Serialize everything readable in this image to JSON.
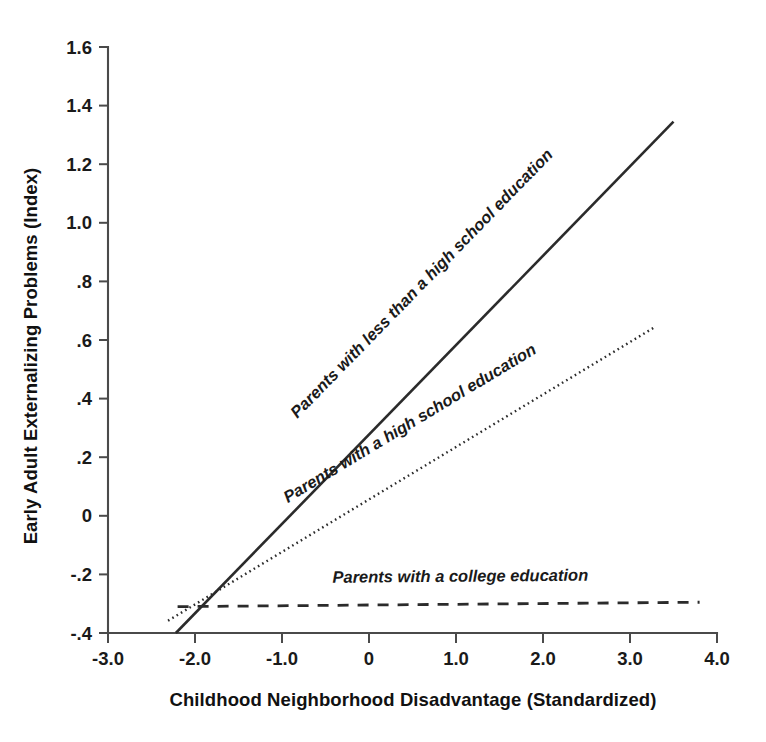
{
  "chart_data": {
    "type": "line",
    "title": "",
    "subtitle": "",
    "xlabel": "Childhood Neighborhood Disadvantage (Standardized)",
    "ylabel": "Early Adult Externalizing Problems (Index)",
    "xlim": [
      -3.0,
      4.0
    ],
    "ylim": [
      -0.4,
      1.6
    ],
    "grid": false,
    "legend_position": "inline-along-lines",
    "xticks": [
      -3.0,
      -2.0,
      -1.0,
      0,
      1.0,
      2.0,
      3.0,
      4.0
    ],
    "xticklabels": [
      "-3.0",
      "-2.0",
      "-1.0",
      "0",
      "1.0",
      "2.0",
      "3.0",
      "4.0"
    ],
    "yticks": [
      -0.4,
      -0.2,
      0,
      0.2,
      0.4,
      0.6,
      0.8,
      1.0,
      1.2,
      1.4,
      1.6
    ],
    "yticklabels": [
      "-.4",
      "-.2",
      "0",
      ".2",
      ".4",
      ".6",
      ".8",
      "1.0",
      "1.2",
      "1.4",
      "1.6"
    ],
    "series": [
      {
        "name": "Parents with less than a high school education",
        "style": "solid",
        "x": [
          -2.22,
          3.5
        ],
        "y": [
          -0.4,
          1.345
        ],
        "slope": 0.305,
        "intercept": 0.277,
        "label": "Parents with less than a high school education",
        "label_x": 0.65,
        "label_y": 0.78
      },
      {
        "name": "Parents with a high school education",
        "style": "dotted",
        "x": [
          -2.31,
          3.29
        ],
        "y": [
          -0.358,
          0.645
        ],
        "slope": 0.179,
        "intercept": 0.055,
        "label": "Parents with a high school education",
        "label_x": 0.5,
        "label_y": 0.3,
        "label_anchor_note": "runs along dotted line"
      },
      {
        "name": "Parents with a college education",
        "style": "dashed",
        "x": [
          -2.2,
          3.8
        ],
        "y": [
          -0.31,
          -0.295
        ],
        "slope": 0.0025,
        "intercept": -0.3045,
        "label": "Parents with a college education",
        "label_x": 1.05,
        "label_y": -0.225
      }
    ],
    "colors": {
      "line": "#2b2b2b",
      "axis": "#4a4a4a",
      "text": "#1a1a1a",
      "background": "#ffffff"
    }
  },
  "figure": {
    "background_color": "#ffffff"
  }
}
